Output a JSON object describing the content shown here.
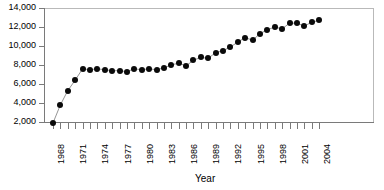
{
  "chart_data": {
    "type": "line",
    "title": "",
    "xlabel": "Year",
    "ylabel": "",
    "grid": false,
    "legend": null,
    "marker": "filled-circle",
    "xlim": [
      1967,
      2005
    ],
    "ylim": [
      2000,
      14000
    ],
    "y_ticks": [
      2000,
      4000,
      6000,
      8000,
      10000,
      12000,
      14000
    ],
    "y_tick_labels": [
      "2,000",
      "4,000",
      "6,000",
      "8,000",
      "10,000",
      "12,000",
      "14,000"
    ],
    "x_ticks": [
      1968,
      1969,
      1970,
      1971,
      1972,
      1973,
      1974,
      1975,
      1976,
      1977,
      1978,
      1979,
      1980,
      1981,
      1982,
      1983,
      1984,
      1985,
      1986,
      1987,
      1988,
      1989,
      1990,
      1991,
      1992,
      1993,
      1994,
      1995,
      1996,
      1997,
      1998,
      1999,
      2000,
      2001,
      2002,
      2003,
      2004
    ],
    "x_tick_labels": [
      "1968",
      "1971",
      "1974",
      "1977",
      "1980",
      "1983",
      "1986",
      "1989",
      "1992",
      "1995",
      "1998",
      "2001",
      "2004"
    ],
    "x_label_interval": 3,
    "x": [
      1968,
      1969,
      1970,
      1971,
      1972,
      1973,
      1974,
      1975,
      1976,
      1977,
      1978,
      1979,
      1980,
      1981,
      1982,
      1983,
      1984,
      1985,
      1986,
      1987,
      1988,
      1989,
      1990,
      1991,
      1992,
      1993,
      1994,
      1995,
      1996,
      1997,
      1998,
      1999,
      2000,
      2001,
      2002,
      2003,
      2004
    ],
    "values": [
      1900,
      3800,
      5300,
      6400,
      7600,
      7500,
      7600,
      7500,
      7400,
      7400,
      7300,
      7600,
      7500,
      7600,
      7500,
      7700,
      8000,
      8200,
      7900,
      8500,
      8800,
      8700,
      9300,
      9500,
      9900,
      10400,
      10900,
      10600,
      11300,
      11700,
      12000,
      11800,
      12400,
      12400,
      12100,
      12500,
      12700
    ],
    "series_color": "#0a0a0a",
    "line_color": "#7a7a7a",
    "axis_color": "#7a7a7a",
    "frame_color": "#b9b9b9",
    "background": "#ffffff"
  }
}
